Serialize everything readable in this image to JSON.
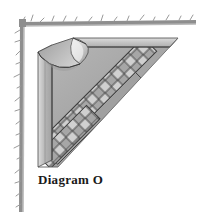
{
  "figure": {
    "caption": "Diagram O",
    "kind": "folded-corner-quilt-diagram"
  },
  "canvas": {
    "width": 200,
    "height": 220,
    "background": "#ffffff"
  },
  "border": {
    "name": "torn-paper-edge",
    "sides": [
      "left",
      "top"
    ],
    "color": "#8a8a8a",
    "shadow_color": "#b5b5b5",
    "left_x": 20,
    "top_y": 22,
    "thickness": 3
  },
  "palette": {
    "outline": "#3b3b3b",
    "light": "#d0d0d0",
    "light2": "#c4c4c4",
    "mid": "#a8a8a8",
    "mid2": "#9a9a9a",
    "dark": "#8c8c8c",
    "darker": "#7d7d7d",
    "curl_highlight": "#e2e2e2",
    "curl_shadow": "#8f8f8f",
    "white": "#ffffff"
  },
  "shape": {
    "apex_x": 73,
    "apex_y": 38,
    "top_right_x": 178,
    "top_right_y": 38,
    "bottom_left_x": 38,
    "bottom_left_y": 167,
    "strip_width": 14,
    "band_height": 13
  },
  "lattice": {
    "name": "diamond-lattice-band",
    "diamond_size": 9,
    "rows": 2,
    "fill_light": "#d0d0d0",
    "fill_mid": "#9a9a9a",
    "line_color": "#3b3b3b"
  },
  "curl": {
    "name": "peeled-corner-fold",
    "highlight": "#e6e6e6",
    "shade": "#9b9b9b",
    "edge": "#3b3b3b"
  }
}
